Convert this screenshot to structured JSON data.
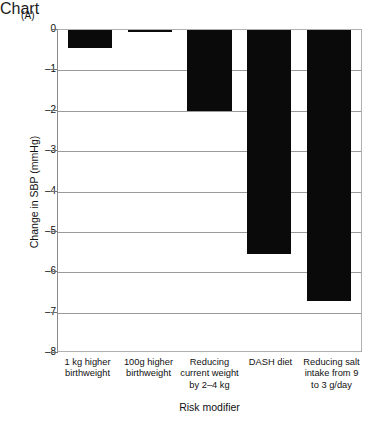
{
  "panel": {
    "label": "(A)"
  },
  "chart_data": {
    "type": "bar",
    "title": "",
    "xlabel": "Risk modifier",
    "ylabel": "Change in SBP (mmHg)",
    "categories": [
      "1 kg higher birthweight",
      "100g higher birthweight",
      "Reducing current weight by 2–4 kg",
      "DASH diet",
      "Reducing salt intake from 9 to 3 g/day"
    ],
    "values": [
      -0.45,
      -0.05,
      -2.0,
      -5.55,
      -6.7
    ],
    "ylim": [
      -8,
      0
    ],
    "yticks": [
      0,
      -1,
      -2,
      -3,
      -4,
      -5,
      -6,
      -7,
      -8
    ],
    "ytick_labels": [
      "0",
      "–1",
      "–2",
      "–3",
      "–4",
      "–5",
      "–6",
      "–7",
      "–8"
    ],
    "grid": true,
    "legend": "none",
    "bar_color": "#0a0a0a",
    "grid_color": "#9a9a9a",
    "background": "#ffffff"
  }
}
